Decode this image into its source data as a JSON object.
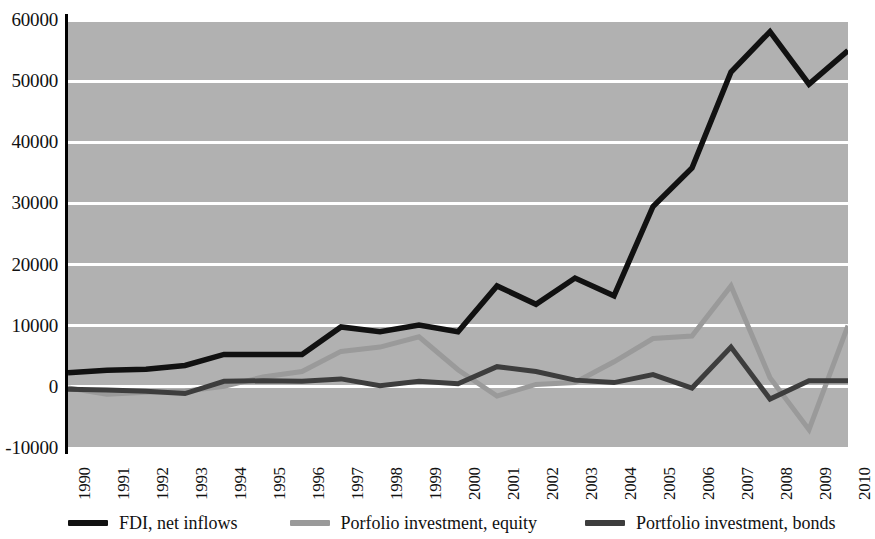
{
  "chart_data": {
    "type": "line",
    "title": "",
    "subtitle": "",
    "xlabel": "",
    "ylabel": "",
    "categories": [
      "1990",
      "1991",
      "1992",
      "1993",
      "1994",
      "1995",
      "1996",
      "1997",
      "1998",
      "1999",
      "2000",
      "2001",
      "2002",
      "2003",
      "2004",
      "2005",
      "2006",
      "2007",
      "2008",
      "2009",
      "2010"
    ],
    "ylim": [
      -10000,
      60000
    ],
    "ytick_labels": [
      "-10000",
      "0",
      "10000",
      "20000",
      "30000",
      "40000",
      "50000",
      "60000"
    ],
    "ytick_values": [
      -10000,
      0,
      10000,
      20000,
      30000,
      40000,
      50000,
      60000
    ],
    "grid": true,
    "legend_position": "bottom",
    "plot_background": "#b1b1b1",
    "gridline_color": "#ffffff",
    "series": [
      {
        "name": "FDI, net inflows",
        "color": "#111111",
        "values": [
          2300,
          2700,
          2900,
          3500,
          5300,
          5300,
          5300,
          9800,
          9000,
          10100,
          9000,
          16500,
          13500,
          17800,
          14900,
          29500,
          35800,
          51500,
          58100,
          49500,
          55000
        ]
      },
      {
        "name": "Porfolio investment, equity",
        "color": "#9a9a9a",
        "values": [
          -200,
          -1200,
          -900,
          -700,
          100,
          1600,
          2500,
          5800,
          6500,
          8200,
          2800,
          -1500,
          400,
          700,
          4100,
          7900,
          8300,
          16500,
          1500,
          -7000,
          10000
        ]
      },
      {
        "name": "Portfolio investment, bonds",
        "color": "#3d3d3d",
        "values": [
          -400,
          -500,
          -700,
          -1100,
          900,
          1000,
          900,
          1300,
          200,
          900,
          500,
          3300,
          2500,
          1100,
          700,
          2000,
          -200,
          6500,
          -2000,
          1000,
          1000
        ]
      }
    ]
  },
  "legend": {
    "items": [
      {
        "label": "FDI, net inflows",
        "color": "#111111",
        "swatch_name": "legend-swatch-fdi"
      },
      {
        "label": "Porfolio investment, equity",
        "color": "#9a9a9a",
        "swatch_name": "legend-swatch-equity"
      },
      {
        "label": "Portfolio investment, bonds",
        "color": "#3d3d3d",
        "swatch_name": "legend-swatch-bonds"
      }
    ]
  }
}
